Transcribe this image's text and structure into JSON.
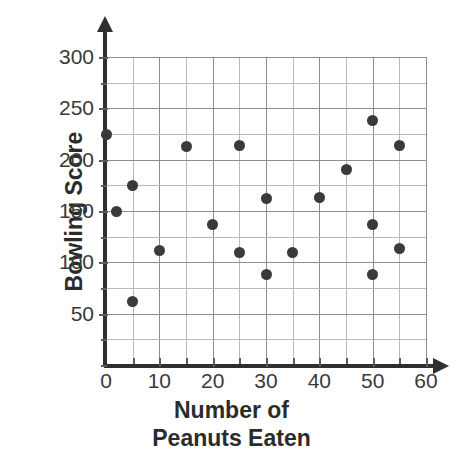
{
  "chart_data": {
    "type": "scatter",
    "title": "",
    "xlabel": "Number of Peanuts Eaten",
    "xlabel_line1": "Number of",
    "xlabel_line2": "Peanuts Eaten",
    "ylabel": "Bowling Score",
    "xlim": [
      0,
      60
    ],
    "ylim": [
      0,
      300
    ],
    "xticks": [
      0,
      10,
      20,
      30,
      40,
      50,
      60
    ],
    "xtick_labels": [
      "0",
      "10",
      "20",
      "30",
      "40",
      "50",
      "60"
    ],
    "yticks": [
      50,
      100,
      150,
      200,
      250,
      300
    ],
    "ytick_labels": [
      "50",
      "100",
      "150",
      "200",
      "250",
      "300"
    ],
    "x_minor_step": 5,
    "y_minor_step": 25,
    "grid": true,
    "grid_color": "#8d8d8d",
    "minor_grid_color": "#b9b9b9",
    "marker_color": "#3a3a3a",
    "axis_color": "#2f2f2f",
    "legend": null,
    "points": [
      {
        "x": 0,
        "y": 225
      },
      {
        "x": 2,
        "y": 150
      },
      {
        "x": 5,
        "y": 175
      },
      {
        "x": 5,
        "y": 62
      },
      {
        "x": 10,
        "y": 112
      },
      {
        "x": 15,
        "y": 213
      },
      {
        "x": 20,
        "y": 137
      },
      {
        "x": 25,
        "y": 214
      },
      {
        "x": 25,
        "y": 110
      },
      {
        "x": 30,
        "y": 162
      },
      {
        "x": 30,
        "y": 88
      },
      {
        "x": 35,
        "y": 110
      },
      {
        "x": 40,
        "y": 163
      },
      {
        "x": 45,
        "y": 190
      },
      {
        "x": 50,
        "y": 238
      },
      {
        "x": 50,
        "y": 137
      },
      {
        "x": 50,
        "y": 88
      },
      {
        "x": 55,
        "y": 214
      },
      {
        "x": 55,
        "y": 113
      }
    ]
  }
}
